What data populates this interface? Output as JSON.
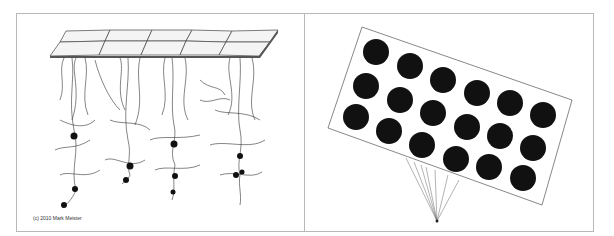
{
  "figure": {
    "left_panel": {
      "description": "Drawing of pixel pads on a surface with neurons/axons hanging below",
      "pad_grid": {
        "rows": 2,
        "cols": 5
      },
      "neuron_columns": 4,
      "credit": "(c) 2010 Mark Meister"
    },
    "right_panel": {
      "description": "Tilted rectangular electrode array with 18 black dots connected by wires to a single point",
      "dot_grid": {
        "rows": 3,
        "cols": 6
      },
      "dot_color": "#111111",
      "wire_count": 7
    },
    "colors": {
      "frame": "#b8b8b8",
      "ink": "#222222",
      "background": "#ffffff"
    }
  }
}
